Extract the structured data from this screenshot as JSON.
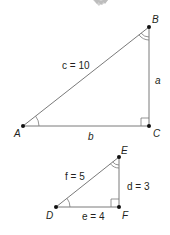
{
  "decoration": {
    "icon": "grey-chevron-banner"
  },
  "triangles": [
    {
      "name": "ABC",
      "vertices": {
        "A": "A",
        "B": "B",
        "C": "C"
      },
      "right_angle_at": "C",
      "single_arc_at": "A",
      "double_arc_at": "B",
      "sides": {
        "hypotenuse": "c = 10",
        "vertical": "a",
        "horizontal": "b"
      }
    },
    {
      "name": "DEF",
      "vertices": {
        "D": "D",
        "E": "E",
        "F": "F"
      },
      "right_angle_at": "F",
      "single_arc_at": "D",
      "double_arc_at": "E",
      "sides": {
        "hypotenuse": "f = 5",
        "vertical": "d = 3",
        "horizontal": "e = 4"
      }
    }
  ],
  "colors": {
    "line": "#7a7a7a",
    "text": "#231f20",
    "vertex": "#111111",
    "decoration": "#c8c8c8"
  }
}
